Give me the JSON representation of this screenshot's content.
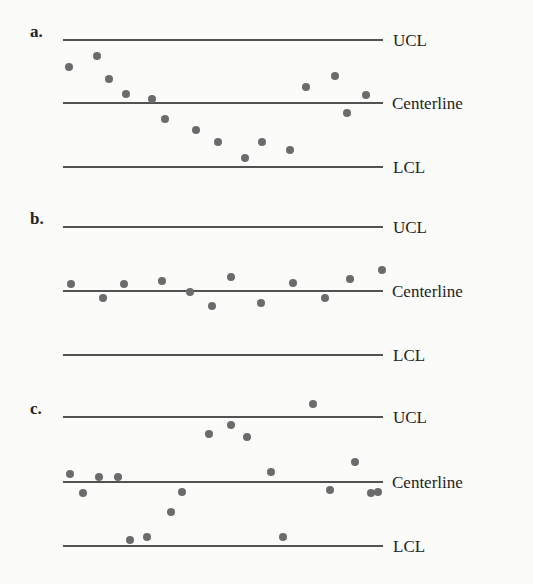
{
  "chart_data": [
    {
      "type": "scatter",
      "label": "a.",
      "lines": [
        {
          "name": "UCL",
          "y": 40
        },
        {
          "name": "Centerline",
          "y": 103
        },
        {
          "name": "LCL",
          "y": 167
        }
      ],
      "points": [
        [
          69,
          67
        ],
        [
          97,
          56
        ],
        [
          109,
          79
        ],
        [
          126,
          94
        ],
        [
          152,
          99
        ],
        [
          165,
          119
        ],
        [
          196,
          130
        ],
        [
          218,
          142
        ],
        [
          245,
          158
        ],
        [
          262,
          142
        ],
        [
          290,
          150
        ],
        [
          306,
          87
        ],
        [
          335,
          76
        ],
        [
          347,
          113
        ],
        [
          366,
          95
        ]
      ]
    },
    {
      "type": "scatter",
      "label": "b.",
      "lines": [
        {
          "name": "UCL",
          "y": 227
        },
        {
          "name": "Centerline",
          "y": 291
        },
        {
          "name": "LCL",
          "y": 355
        }
      ],
      "points": [
        [
          71,
          284
        ],
        [
          103,
          298
        ],
        [
          124,
          284
        ],
        [
          162,
          281
        ],
        [
          190,
          292
        ],
        [
          212,
          306
        ],
        [
          231,
          277
        ],
        [
          261,
          303
        ],
        [
          293,
          283
        ],
        [
          325,
          298
        ],
        [
          350,
          279
        ],
        [
          382,
          270
        ]
      ]
    },
    {
      "type": "scatter",
      "label": "c.",
      "lines": [
        {
          "name": "UCL",
          "y": 417
        },
        {
          "name": "Centerline",
          "y": 482
        },
        {
          "name": "LCL",
          "y": 546
        }
      ],
      "points": [
        [
          70,
          474
        ],
        [
          83,
          493
        ],
        [
          99,
          477
        ],
        [
          118,
          477
        ],
        [
          130,
          540
        ],
        [
          147,
          537
        ],
        [
          171,
          512
        ],
        [
          182,
          492
        ],
        [
          209,
          434
        ],
        [
          231,
          425
        ],
        [
          247,
          437
        ],
        [
          271,
          472
        ],
        [
          283,
          537
        ],
        [
          313,
          404
        ],
        [
          330,
          490
        ],
        [
          355,
          462
        ],
        [
          378,
          492
        ],
        [
          371,
          493
        ]
      ]
    }
  ],
  "colors": {
    "line": "#1a1a1a",
    "dot": "#6b6b6b",
    "text": "#222222"
  }
}
